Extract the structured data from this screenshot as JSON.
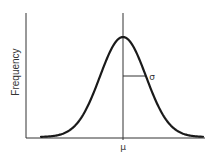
{
  "chart_data": {
    "type": "line",
    "title": "",
    "xlabel": "",
    "ylabel": "Frequency",
    "x_tick_labels": [
      "μ"
    ],
    "annotations": [
      {
        "text": "μ",
        "meaning": "mean",
        "position": "x-axis at curve peak"
      },
      {
        "text": "σ",
        "meaning": "standard deviation",
        "position": "horizontal segment from mean line to curve inflection point"
      }
    ],
    "series": [
      {
        "name": "normal distribution",
        "x": [
          -3,
          -2.5,
          -2,
          -1.5,
          -1,
          -0.5,
          0,
          0.5,
          1,
          1.5,
          2,
          2.5,
          3
        ],
        "values": [
          0.011,
          0.044,
          0.135,
          0.325,
          0.607,
          0.882,
          1.0,
          0.882,
          0.607,
          0.325,
          0.135,
          0.044,
          0.011
        ]
      }
    ],
    "axis_ticks": false,
    "grid": false,
    "legend": null
  },
  "labels": {
    "ylabel": "Frequency",
    "mean": "μ",
    "sigma": "σ"
  },
  "colors": {
    "curve": "#1a1a1a",
    "axes": "#333333",
    "background": "#ffffff"
  }
}
